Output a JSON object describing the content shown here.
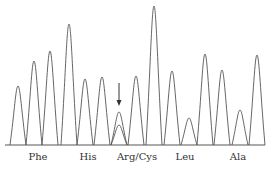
{
  "chart_data": {
    "type": "line",
    "title": "",
    "xlabel": "",
    "ylabel": "",
    "grid": false,
    "legend": null,
    "codon_labels": [
      {
        "text": "Phe",
        "x": 38
      },
      {
        "text": "His",
        "x": 88
      },
      {
        "text": "Arg/Cys",
        "x": 137
      },
      {
        "text": "Leu",
        "x": 185
      },
      {
        "text": "Ala",
        "x": 238
      }
    ],
    "peaks": [
      {
        "x": 18,
        "height": 59
      },
      {
        "x": 34,
        "height": 84
      },
      {
        "x": 50,
        "height": 94
      },
      {
        "x": 69,
        "height": 121
      },
      {
        "x": 85,
        "height": 66
      },
      {
        "x": 102,
        "height": 68
      },
      {
        "x": 119,
        "height": 33,
        "secondary_height": 20,
        "annotated": true
      },
      {
        "x": 136,
        "height": 69
      },
      {
        "x": 154,
        "height": 139
      },
      {
        "x": 172,
        "height": 74
      },
      {
        "x": 189,
        "height": 27
      },
      {
        "x": 205,
        "height": 91
      },
      {
        "x": 222,
        "height": 75
      },
      {
        "x": 240,
        "height": 35
      },
      {
        "x": 257,
        "height": 90
      }
    ],
    "baseline_y": 145,
    "annotation": {
      "type": "arrow",
      "x": 119,
      "y_start": 83,
      "y_end": 106
    },
    "line_color": "#555555"
  }
}
